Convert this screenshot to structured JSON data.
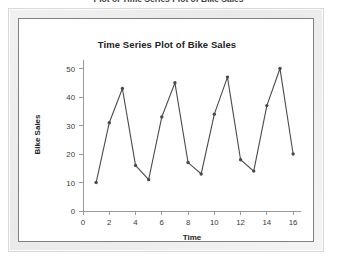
{
  "page": {
    "heading": "Plot of Time Series Plot of Bike Sales"
  },
  "chart_data": {
    "type": "line",
    "title": "Time Series Plot of Bike Sales",
    "xlabel": "Time",
    "ylabel": "Bike Sales",
    "xlim": [
      0,
      16.6
    ],
    "ylim": [
      0,
      53
    ],
    "grid": false,
    "legend": null,
    "xticks": [
      0,
      2,
      4,
      6,
      8,
      10,
      12,
      14,
      16
    ],
    "yticks": [
      0,
      10,
      20,
      30,
      40,
      50
    ],
    "marker": "filled-circle",
    "line_color": "#4a4a4a",
    "x": [
      1,
      2,
      3,
      4,
      5,
      6,
      7,
      8,
      9,
      10,
      11,
      12,
      13,
      14,
      15,
      16
    ],
    "values": [
      10,
      31,
      43,
      16,
      11,
      33,
      45,
      17,
      13,
      34,
      47,
      18,
      14,
      37,
      50,
      20
    ],
    "series": [
      {
        "name": "Bike Sales",
        "values": [
          10,
          31,
          43,
          16,
          11,
          33,
          45,
          17,
          13,
          34,
          47,
          18,
          14,
          37,
          50,
          20
        ]
      }
    ]
  },
  "axis": {
    "y_ticks_labels": [
      "0",
      "10",
      "20",
      "30",
      "40",
      "50"
    ],
    "x_ticks_labels": [
      "0",
      "2",
      "4",
      "6",
      "8",
      "10",
      "12",
      "14",
      "16"
    ]
  }
}
